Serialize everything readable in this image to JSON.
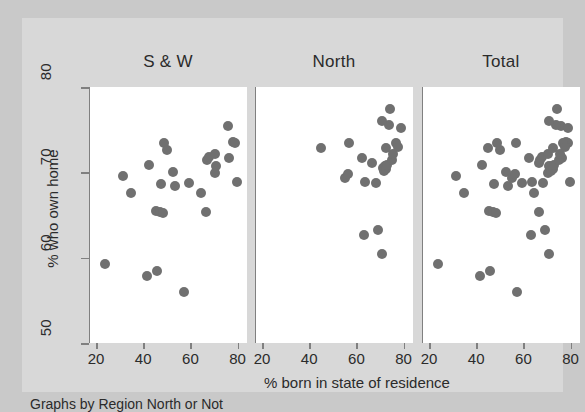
{
  "chart_data": {
    "type": "scatter",
    "title": "",
    "subtitle": "",
    "note": "Graphs by Region North or Not",
    "xlabel": "% born in state of residence",
    "ylabel": "% who own home",
    "xlim": [
      17,
      84
    ],
    "ylim": [
      50,
      80
    ],
    "xticks": [
      20,
      40,
      60,
      80
    ],
    "yticks": [
      50,
      60,
      70,
      80
    ],
    "grid": false,
    "legend": "none",
    "marker_color": "#707070",
    "panel_background": "#ffffff",
    "figure_background": "#d8d8d8",
    "axis_color": "#808080",
    "text_color": "#2b2b2b",
    "panels": [
      {
        "name": "sw",
        "label": "S & W",
        "points": [
          [
            23.3,
            59.3
          ],
          [
            30.8,
            69.6
          ],
          [
            34.3,
            67.6
          ],
          [
            41.3,
            57.8
          ],
          [
            45.2,
            58.5
          ],
          [
            41.8,
            70.9
          ],
          [
            44.8,
            65.5
          ],
          [
            46.5,
            65.4
          ],
          [
            47.8,
            65.2
          ],
          [
            47.0,
            68.6
          ],
          [
            48.5,
            73.5
          ],
          [
            49.5,
            72.6
          ],
          [
            52.0,
            70.0
          ],
          [
            53.2,
            68.4
          ],
          [
            56.8,
            56.0
          ],
          [
            58.8,
            68.8
          ],
          [
            64.0,
            67.6
          ],
          [
            66.0,
            65.4
          ],
          [
            66.5,
            71.5
          ],
          [
            67.5,
            71.8
          ],
          [
            69.8,
            72.2
          ],
          [
            70.2,
            70.8
          ],
          [
            70.0,
            69.9
          ],
          [
            75.3,
            75.4
          ],
          [
            76.0,
            71.7
          ],
          [
            77.8,
            73.6
          ],
          [
            78.5,
            73.4
          ],
          [
            79.2,
            68.9
          ]
        ]
      },
      {
        "name": "north",
        "label": "North",
        "points": [
          [
            44.5,
            72.9
          ],
          [
            54.8,
            69.4
          ],
          [
            55.8,
            69.8
          ],
          [
            56.5,
            73.5
          ],
          [
            62.0,
            71.7
          ],
          [
            62.8,
            62.7
          ],
          [
            63.3,
            68.9
          ],
          [
            66.0,
            71.1
          ],
          [
            68.8,
            63.3
          ],
          [
            68.0,
            68.7
          ],
          [
            70.5,
            60.4
          ],
          [
            71.0,
            70.5
          ],
          [
            71.3,
            70.2
          ],
          [
            71.8,
            70.8
          ],
          [
            72.2,
            70.4
          ],
          [
            72.5,
            70.9
          ],
          [
            72.0,
            72.8
          ],
          [
            73.2,
            75.5
          ],
          [
            70.5,
            76.0
          ],
          [
            74.0,
            77.4
          ],
          [
            74.5,
            71.5
          ],
          [
            75.0,
            72.1
          ],
          [
            76.5,
            73.4
          ],
          [
            77.0,
            73.0
          ],
          [
            78.5,
            75.2
          ]
        ]
      },
      {
        "name": "total",
        "label": "Total",
        "points": [
          [
            23.3,
            59.3
          ],
          [
            30.8,
            69.6
          ],
          [
            34.3,
            67.6
          ],
          [
            41.3,
            57.8
          ],
          [
            45.2,
            58.5
          ],
          [
            41.8,
            70.9
          ],
          [
            44.8,
            65.5
          ],
          [
            46.5,
            65.4
          ],
          [
            47.8,
            65.2
          ],
          [
            47.0,
            68.6
          ],
          [
            48.5,
            73.5
          ],
          [
            49.5,
            72.6
          ],
          [
            52.0,
            70.0
          ],
          [
            53.2,
            68.4
          ],
          [
            56.8,
            56.0
          ],
          [
            58.8,
            68.8
          ],
          [
            64.0,
            67.6
          ],
          [
            66.0,
            65.4
          ],
          [
            66.5,
            71.5
          ],
          [
            67.5,
            71.8
          ],
          [
            69.8,
            72.2
          ],
          [
            70.2,
            70.8
          ],
          [
            70.0,
            69.9
          ],
          [
            75.3,
            75.4
          ],
          [
            76.0,
            71.7
          ],
          [
            77.8,
            73.6
          ],
          [
            78.5,
            73.4
          ],
          [
            79.2,
            68.9
          ],
          [
            44.5,
            72.9
          ],
          [
            54.8,
            69.4
          ],
          [
            55.8,
            69.8
          ],
          [
            56.5,
            73.5
          ],
          [
            62.0,
            71.7
          ],
          [
            62.8,
            62.7
          ],
          [
            63.3,
            68.9
          ],
          [
            66.0,
            71.1
          ],
          [
            68.8,
            63.3
          ],
          [
            68.0,
            68.7
          ],
          [
            70.5,
            60.4
          ],
          [
            71.0,
            70.5
          ],
          [
            71.3,
            70.2
          ],
          [
            71.8,
            70.8
          ],
          [
            72.2,
            70.4
          ],
          [
            72.5,
            70.9
          ],
          [
            72.0,
            72.8
          ],
          [
            73.2,
            75.5
          ],
          [
            70.5,
            76.0
          ],
          [
            74.0,
            77.4
          ],
          [
            74.5,
            71.5
          ],
          [
            75.0,
            72.1
          ],
          [
            76.5,
            73.4
          ],
          [
            77.0,
            73.0
          ],
          [
            78.5,
            75.2
          ]
        ]
      }
    ]
  }
}
